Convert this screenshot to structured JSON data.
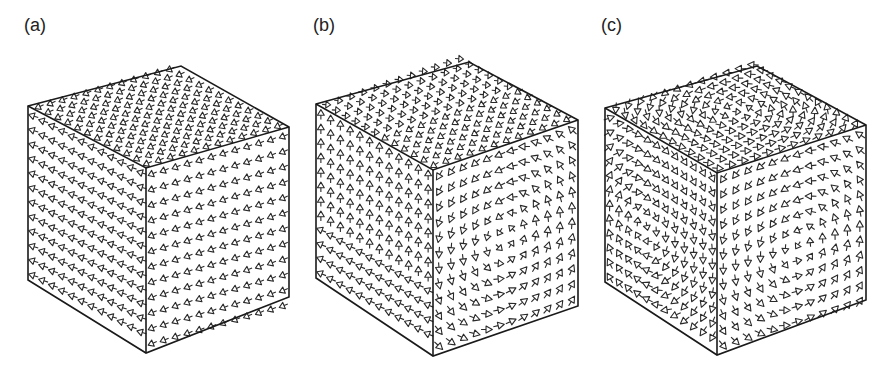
{
  "figure": {
    "stroke_color": "#2a2a2a",
    "edge_color": "#1a1a1a",
    "background": "#ffffff"
  },
  "panels": [
    {
      "label": "(a)",
      "label_pos": [
        24,
        16
      ],
      "pattern": "uniform",
      "grid": 12,
      "cube": {
        "top_left": [
          28,
          106
        ],
        "top_back": [
          181,
          66
        ],
        "top_right": [
          289,
          127
        ],
        "front_top": [
          146,
          168
        ],
        "bottom_left": [
          28,
          280
        ],
        "bottom_front": [
          146,
          353
        ],
        "bottom_right": [
          289,
          297
        ]
      }
    },
    {
      "label": "(b)",
      "label_pos": [
        313,
        16
      ],
      "pattern": "single_vortex",
      "grid": 12,
      "cube": {
        "top_left": [
          316,
          104
        ],
        "top_back": [
          469,
          62
        ],
        "top_right": [
          578,
          120
        ],
        "front_top": [
          433,
          170
        ],
        "bottom_left": [
          316,
          278
        ],
        "bottom_front": [
          433,
          356
        ],
        "bottom_right": [
          578,
          306
        ]
      }
    },
    {
      "label": "(c)",
      "label_pos": [
        601,
        16
      ],
      "pattern": "double_vortex",
      "grid": 12,
      "cube": {
        "top_left": [
          605,
          108
        ],
        "top_back": [
          757,
          66
        ],
        "top_right": [
          866,
          125
        ],
        "front_top": [
          717,
          173
        ],
        "bottom_left": [
          605,
          282
        ],
        "bottom_front": [
          717,
          355
        ],
        "bottom_right": [
          866,
          300
        ]
      }
    }
  ]
}
